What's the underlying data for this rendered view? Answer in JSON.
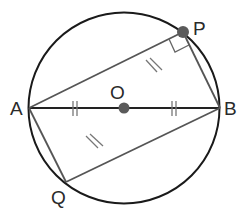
{
  "diagram": {
    "type": "circle-geometry",
    "circle": {
      "cx": 124,
      "cy": 108,
      "r": 95,
      "stroke": "#1a1a1a"
    },
    "points": {
      "A": {
        "label": "A",
        "x": 29,
        "y": 108,
        "label_x": 10,
        "label_y": 115
      },
      "B": {
        "label": "B",
        "x": 220,
        "y": 108,
        "label_x": 224,
        "label_y": 115
      },
      "O": {
        "label": "O",
        "x": 124,
        "y": 108,
        "label_x": 110,
        "label_y": 100
      },
      "P": {
        "label": "P",
        "x": 183,
        "y": 32,
        "label_x": 193,
        "label_y": 35
      },
      "Q": {
        "label": "Q",
        "x": 66,
        "y": 182,
        "label_x": 51,
        "label_y": 202
      }
    },
    "segments": [
      "AB",
      "AP",
      "PB",
      "AQ",
      "QB"
    ],
    "markings": {
      "AO_BO": "double tick (equal)",
      "AP_QB": "double slash (equal)",
      "angle_APB": "right angle"
    },
    "colors": {
      "stroke": "#1a1a1a",
      "gray_stroke": "#555555",
      "point_fill": "#5a5a5a",
      "label": "#2a2a2a"
    }
  }
}
